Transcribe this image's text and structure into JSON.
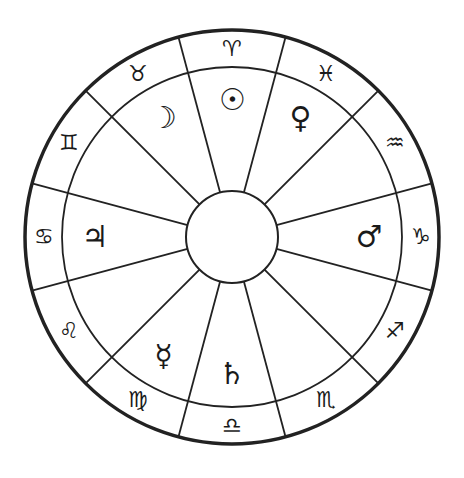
{
  "wheel": {
    "center": [
      232,
      237
    ],
    "outer_radius": 207,
    "inner_radius": 170,
    "hub_radius": 46,
    "house_count": 12,
    "first_cusp_angle_deg": 15,
    "stroke_color": "#222222",
    "background": "#ffffff"
  },
  "signs": [
    {
      "name": "aries",
      "glyph": "♈",
      "angle_deg": 90
    },
    {
      "name": "taurus",
      "glyph": "♉",
      "angle_deg": 120
    },
    {
      "name": "gemini",
      "glyph": "♊",
      "angle_deg": 150
    },
    {
      "name": "cancer",
      "glyph": "♋",
      "angle_deg": 180
    },
    {
      "name": "leo",
      "glyph": "♌",
      "angle_deg": 210
    },
    {
      "name": "virgo",
      "glyph": "♍",
      "angle_deg": 240
    },
    {
      "name": "libra",
      "glyph": "♎",
      "angle_deg": 270
    },
    {
      "name": "scorpio",
      "glyph": "♏",
      "angle_deg": 300
    },
    {
      "name": "sagittarius",
      "glyph": "♐",
      "angle_deg": 330
    },
    {
      "name": "capricorn",
      "glyph": "♑",
      "angle_deg": 0
    },
    {
      "name": "aquarius",
      "glyph": "♒",
      "angle_deg": 30
    },
    {
      "name": "pisces",
      "glyph": "♓",
      "angle_deg": 60
    }
  ],
  "planets": [
    {
      "name": "sun",
      "glyph": "☉",
      "angle_deg": 90
    },
    {
      "name": "moon",
      "glyph": "☽",
      "angle_deg": 120
    },
    {
      "name": "venus",
      "glyph": "♀",
      "angle_deg": 60
    },
    {
      "name": "jupiter",
      "glyph": "♃",
      "angle_deg": 180
    },
    {
      "name": "mars",
      "glyph": "♂",
      "angle_deg": 0
    },
    {
      "name": "mercury",
      "glyph": "☿",
      "angle_deg": 240
    },
    {
      "name": "saturn",
      "glyph": "♄",
      "angle_deg": 270
    }
  ]
}
